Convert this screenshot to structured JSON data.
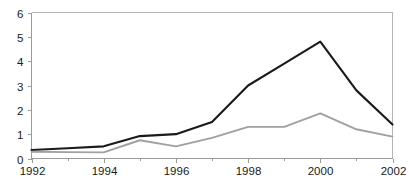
{
  "chart_data": {
    "type": "line",
    "title": "",
    "subtitle": "",
    "xlabel": "",
    "ylabel": "",
    "x": [
      1992,
      1993,
      1994,
      1995,
      1996,
      1997,
      1998,
      1999,
      2000,
      2001,
      2002
    ],
    "xlim": [
      1992,
      2002
    ],
    "ylim": [
      0,
      6
    ],
    "y_ticks": [
      0,
      1,
      2,
      3,
      4,
      5,
      6
    ],
    "y_tick_labels": [
      "0",
      "1",
      "2",
      "3",
      "4",
      "5",
      "6"
    ],
    "x_ticks": [
      1992,
      1994,
      1996,
      1998,
      2000,
      2002
    ],
    "x_tick_labels": [
      "1992",
      "1994",
      "1996",
      "1998",
      "2000",
      "2002"
    ],
    "grid": false,
    "legend": "none",
    "series": [
      {
        "name": "dark-series",
        "color": "#1a1a1a",
        "line_width": 2.1,
        "values": [
          0.35,
          0.42,
          0.5,
          0.92,
          1.0,
          1.5,
          3.0,
          3.9,
          4.8,
          2.8,
          1.4
        ]
      },
      {
        "name": "gray-series",
        "color": "#a0a0a0",
        "line_width": 1.9,
        "values": [
          0.28,
          0.26,
          0.25,
          0.75,
          0.5,
          0.85,
          1.3,
          1.3,
          1.85,
          1.2,
          0.9
        ]
      }
    ],
    "annotations": []
  },
  "axes": {
    "axis_color": "#9a9a9a",
    "top_rule_color": "#b5b5b5",
    "tick_label_color": "#1a1a1a"
  },
  "caption": {
    "ghost_text": ""
  }
}
